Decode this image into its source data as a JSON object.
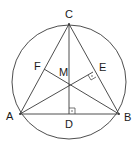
{
  "diagram": {
    "type": "geometry",
    "points": {
      "A": {
        "label": "A",
        "x": 20,
        "y": 114
      },
      "B": {
        "label": "B",
        "x": 119,
        "y": 114
      },
      "C": {
        "label": "C",
        "x": 69,
        "y": 24
      },
      "D": {
        "label": "D",
        "x": 69,
        "y": 114
      },
      "E": {
        "label": "E",
        "x": 93,
        "y": 72
      },
      "F": {
        "label": "F",
        "x": 44,
        "y": 69
      },
      "M": {
        "label": "M",
        "x": 69,
        "y": 84
      }
    },
    "circle": {
      "cx": 69,
      "cy": 82,
      "r": 57
    },
    "segments": [
      "AB",
      "BC",
      "CA",
      "CD",
      "AE",
      "BF"
    ],
    "right_angles": [
      "D",
      "E"
    ],
    "colors": {
      "stroke": "#3a3a3a",
      "text": "#1a1a1a",
      "background": "#ffffff"
    }
  }
}
